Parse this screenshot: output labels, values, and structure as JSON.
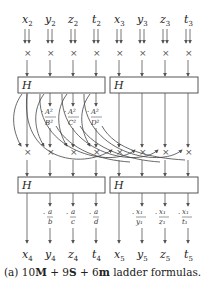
{
  "diagram": {
    "inputs": [
      {
        "var": "x",
        "sub": "2"
      },
      {
        "var": "y",
        "sub": "2"
      },
      {
        "var": "z",
        "sub": "2"
      },
      {
        "var": "t",
        "sub": "2"
      },
      {
        "var": "x",
        "sub": "3"
      },
      {
        "var": "y",
        "sub": "3"
      },
      {
        "var": "z",
        "sub": "3"
      },
      {
        "var": "t",
        "sub": "3"
      }
    ],
    "outputs": [
      {
        "var": "x",
        "sub": "4"
      },
      {
        "var": "y",
        "sub": "4"
      },
      {
        "var": "z",
        "sub": "4"
      },
      {
        "var": "t",
        "sub": "4"
      },
      {
        "var": "x",
        "sub": "5"
      },
      {
        "var": "y",
        "sub": "5"
      },
      {
        "var": "z",
        "sub": "5"
      },
      {
        "var": "t",
        "sub": "5"
      }
    ],
    "multiply_symbol": "×",
    "hadamard_label": "H",
    "middle_factors": [
      {
        "num": "A²",
        "den": "B²"
      },
      {
        "num": "A²",
        "den": "C²"
      },
      {
        "num": "A²",
        "den": "D²"
      }
    ],
    "bottom_factors_left": [
      {
        "num": "a",
        "den": "b"
      },
      {
        "num": "a",
        "den": "c"
      },
      {
        "num": "a",
        "den": "d"
      }
    ],
    "bottom_factors_right": [
      {
        "num": "x₁",
        "den": "y₁"
      },
      {
        "num": "x₁",
        "den": "z₁"
      },
      {
        "num": "x₁",
        "den": "t₁"
      }
    ],
    "caption": {
      "prefix": "(a) ",
      "m_count": "10",
      "m_sym": "M",
      "plus1": " + ",
      "s_count": "9",
      "s_sym": "S",
      "plus2": " + ",
      "small_m_count": "6",
      "small_m_sym": "m",
      "suffix": " ladder formulas."
    }
  }
}
